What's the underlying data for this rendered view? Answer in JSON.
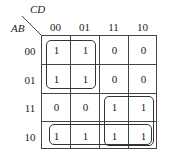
{
  "kmap": {
    "col_var": "CD",
    "row_var": "AB",
    "col_labels": [
      "00",
      "01",
      "11",
      "10"
    ],
    "row_labels": [
      "00",
      "01",
      "11",
      "10"
    ],
    "cells": [
      [
        "1",
        "1",
        "0",
        "0"
      ],
      [
        "1",
        "1",
        "0",
        "0"
      ],
      [
        "0",
        "0",
        "1",
        "1"
      ],
      [
        "1",
        "1",
        "1",
        "1"
      ]
    ],
    "groups": [
      {
        "name": "A'C'",
        "rows": [
          0,
          1
        ],
        "cols": [
          0,
          1
        ]
      },
      {
        "name": "AC",
        "rows": [
          2,
          3
        ],
        "cols": [
          2,
          3
        ]
      },
      {
        "name": "AB'",
        "rows": [
          3
        ],
        "cols": [
          0,
          1,
          2,
          3
        ]
      }
    ]
  }
}
